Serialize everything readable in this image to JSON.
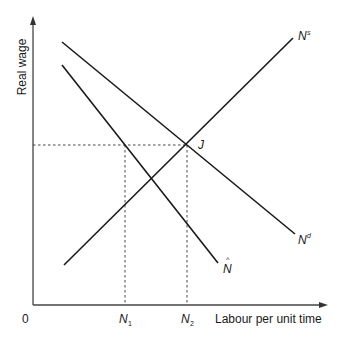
{
  "axes": {
    "y_label": "Real wage",
    "x_label": "Labour per unit time",
    "origin_label": "0"
  },
  "curves": {
    "supply": {
      "label": "N",
      "sup": "s"
    },
    "demand": {
      "label": "N",
      "sup": "d"
    },
    "n_hat": {
      "label": "N",
      "accent": "^"
    }
  },
  "points": {
    "equilibrium": "J"
  },
  "x_ticks": {
    "n1": {
      "label": "N",
      "sub": "1"
    },
    "n2": {
      "label": "N",
      "sub": "2"
    }
  },
  "colors": {
    "line": "#1a1a1a",
    "axis": "#444444",
    "background": "#ffffff"
  }
}
